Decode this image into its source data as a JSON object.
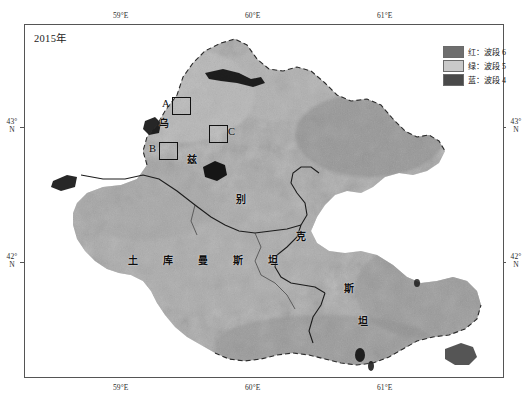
{
  "figure": {
    "title": "2015年",
    "width": 526,
    "height": 416
  },
  "legend": {
    "items": [
      {
        "label": "红：波段 6",
        "color": "#6e6e6e",
        "icon": "color-swatch-icon"
      },
      {
        "label": "绿：波段 5",
        "color": "#c9c9c9",
        "icon": "color-swatch-icon"
      },
      {
        "label": "蓝：波段 4",
        "color": "#4a4a4a",
        "icon": "color-swatch-icon"
      }
    ]
  },
  "axes": {
    "top_ticks": [
      "59°E",
      "60°E",
      "61°E"
    ],
    "bottom_ticks": [
      "59°E",
      "60°E",
      "61°E"
    ],
    "left_ticks": [
      "43°\nN",
      "42°\nN"
    ],
    "right_ticks": [
      "43°\nN",
      "42°\nN"
    ],
    "left_tick_1_deg": "43°",
    "left_tick_1_hem": "N",
    "left_tick_2_deg": "42°",
    "left_tick_2_hem": "N",
    "right_tick_1_deg": "43°",
    "right_tick_1_hem": "N",
    "right_tick_2_deg": "42°",
    "right_tick_2_hem": "N",
    "x_tick_1": "59°E",
    "x_tick_2": "60°E",
    "x_tick_3": "61°E"
  },
  "map_annotations": {
    "study_sites": [
      {
        "letter": "A"
      },
      {
        "letter": "B"
      },
      {
        "letter": "C"
      }
    ],
    "country_turkmenistan": [
      "土",
      "库",
      "曼",
      "斯",
      "坦"
    ],
    "country_uzbekistan": [
      "乌",
      "兹",
      "别",
      "克",
      "斯",
      "坦"
    ],
    "label_wu": "乌",
    "label_zi": "兹",
    "label_bie": "别",
    "label_ke": "克",
    "label_si": "斯",
    "label_tan": "坦",
    "tm_1": "土",
    "tm_2": "库",
    "tm_3": "曼",
    "tm_4": "斯",
    "tm_5": "坦"
  },
  "colors": {
    "frame": "#555555",
    "land_light": "#b8b8b8",
    "land_mid": "#9a9a9a",
    "land_dark": "#7d7d7d",
    "water_dark": "#141414",
    "background": "#ffffff"
  }
}
